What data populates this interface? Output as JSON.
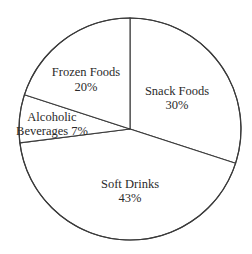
{
  "chart_data": {
    "type": "pie",
    "title": "",
    "start_angle_deg": 0,
    "direction": "clockwise",
    "legend": "none",
    "slices": [
      {
        "label": "Snack Foods",
        "value": 30,
        "display": "30%",
        "color": "#ffffff"
      },
      {
        "label": "Soft Drinks",
        "value": 43,
        "display": "43%",
        "color": "#ffffff"
      },
      {
        "label": "Alcoholic Beverages",
        "value": 7,
        "display": "7%",
        "color": "#ffffff"
      },
      {
        "label": "Frozen Foods",
        "value": 20,
        "display": "20%",
        "color": "#ffffff"
      }
    ]
  },
  "labels": {
    "snack": {
      "line1": "Snack Foods",
      "line2": "30%"
    },
    "soft": {
      "line1": "Soft Drinks",
      "line2": "43%"
    },
    "alcohol": {
      "line1": "Alcoholic",
      "line2": "Beverages 7%"
    },
    "frozen": {
      "line1": "Frozen Foods",
      "line2": "20%"
    }
  },
  "style": {
    "stroke_color": "#3a3a3a",
    "fill_color": "#ffffff",
    "text_color": "#2a2a2a"
  }
}
